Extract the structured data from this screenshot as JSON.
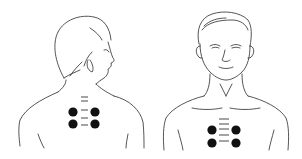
{
  "figures": [
    {
      "id": "back-view",
      "view": "back, head turned right",
      "points": [
        {
          "cx": 73,
          "cy": 112
        },
        {
          "cx": 95,
          "cy": 112
        },
        {
          "cx": 73,
          "cy": 124
        },
        {
          "cx": 95,
          "cy": 124
        }
      ],
      "spine_marks": [
        {
          "x1": 81,
          "x2": 88,
          "y": 97
        },
        {
          "x1": 81,
          "x2": 88,
          "y": 101
        },
        {
          "x1": 81,
          "x2": 88,
          "y": 110
        },
        {
          "x1": 81,
          "x2": 88,
          "y": 118
        },
        {
          "x1": 81,
          "x2": 88,
          "y": 125
        }
      ]
    },
    {
      "id": "front-view",
      "view": "front",
      "points": [
        {
          "cx": 212,
          "cy": 130
        },
        {
          "cx": 236,
          "cy": 130
        },
        {
          "cx": 212,
          "cy": 143
        },
        {
          "cx": 236,
          "cy": 143
        }
      ],
      "sternum_marks": [
        {
          "x1": 219,
          "x2": 229,
          "y": 119
        },
        {
          "x1": 219,
          "x2": 229,
          "y": 124
        },
        {
          "x1": 219,
          "x2": 229,
          "y": 129
        },
        {
          "x1": 219,
          "x2": 229,
          "y": 135
        },
        {
          "x1": 219,
          "x2": 229,
          "y": 141
        }
      ]
    }
  ],
  "colors": {
    "line": "#2a2a2a",
    "dot": "#111111",
    "background": "#ffffff"
  }
}
